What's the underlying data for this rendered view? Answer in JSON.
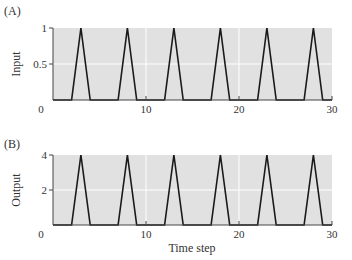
{
  "chart_data": [
    {
      "type": "line",
      "panel_label": "(A)",
      "title": "",
      "xlabel": "",
      "ylabel": "Input",
      "xlim": [
        0,
        30
      ],
      "ylim": [
        0,
        1
      ],
      "xticks": [
        0,
        10,
        20,
        30
      ],
      "yticks": [
        0.5,
        1
      ],
      "ytick_labels": [
        "0.5",
        "1"
      ],
      "xtick_labels": [
        "0",
        "10",
        "20",
        "30"
      ],
      "grid": true,
      "series": [
        {
          "name": "Input",
          "x": [
            0,
            2,
            3,
            4,
            7,
            8,
            9,
            12,
            13,
            14,
            17,
            18,
            19,
            22,
            23,
            24,
            27,
            28,
            29,
            30
          ],
          "y": [
            0,
            0,
            1,
            0,
            0,
            1,
            0,
            0,
            1,
            0,
            0,
            1,
            0,
            0,
            1,
            0,
            0,
            1,
            0,
            0
          ]
        }
      ]
    },
    {
      "type": "line",
      "panel_label": "(B)",
      "title": "",
      "xlabel": "Time step",
      "ylabel": "Output",
      "xlim": [
        0,
        30
      ],
      "ylim": [
        0,
        4
      ],
      "xticks": [
        0,
        10,
        20,
        30
      ],
      "yticks": [
        2,
        4
      ],
      "ytick_labels": [
        "2",
        "4"
      ],
      "xtick_labels": [
        "0",
        "10",
        "20",
        "30"
      ],
      "grid": true,
      "series": [
        {
          "name": "Output",
          "x": [
            0,
            2,
            3,
            4,
            7,
            8,
            9,
            12,
            13,
            14,
            17,
            18,
            19,
            22,
            23,
            24,
            27,
            28,
            29,
            30
          ],
          "y": [
            0,
            0,
            4,
            0,
            0,
            4,
            0,
            0,
            4,
            0,
            0,
            4,
            0,
            0,
            4,
            0,
            0,
            4,
            0,
            0
          ]
        }
      ]
    }
  ],
  "colors": {
    "plot_bg": "#e1e1e1",
    "grid": "#ffffff",
    "line": "#1a1a1a",
    "axis": "#333333"
  }
}
